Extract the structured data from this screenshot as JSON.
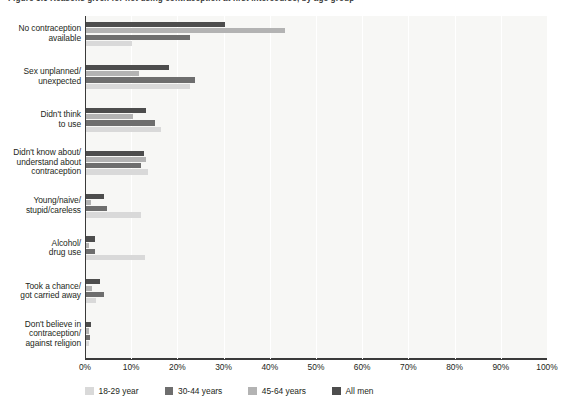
{
  "chart_data": {
    "type": "bar",
    "orientation": "horizontal",
    "title": "Figure 3.6  Reasons given for not using contraception at first intercourse, by age group",
    "xlabel": "",
    "ylabel": "",
    "xlim": [
      0,
      100
    ],
    "xtick_labels": [
      "0%",
      "10%",
      "20%",
      "30%",
      "40%",
      "50%",
      "60%",
      "70%",
      "80%",
      "90%",
      "100%"
    ],
    "xtick_values": [
      0,
      10,
      20,
      30,
      40,
      50,
      60,
      70,
      80,
      90,
      100
    ],
    "grid": true,
    "legend_position": "bottom",
    "categories": [
      "No contraception available",
      "Sex unplanned/ unexpected",
      "Didn't think to use",
      "Didn't know about/ understand about contraception",
      "Young/naive/ stupid/careless",
      "Alcohol/ drug use",
      "Took a chance/ got carried away",
      "Don't believe in contraception/ against religion"
    ],
    "category_lines": [
      [
        "No contraception",
        "available"
      ],
      [
        "Sex unplanned/",
        "unexpected"
      ],
      [
        "Didn't think",
        "to use"
      ],
      [
        "Didn't know about/",
        "understand about",
        "contraception"
      ],
      [
        "Young/naive/",
        "stupid/careless"
      ],
      [
        "Alcohol/",
        "drug use"
      ],
      [
        "Took a chance/",
        "got carried away"
      ],
      [
        "Don't believe in",
        "contraception/",
        "against religion"
      ]
    ],
    "series": [
      {
        "name": "All men",
        "color": "#4d4d4d",
        "values": [
          30.0,
          18.0,
          13.0,
          12.5,
          4.0,
          2.0,
          3.0,
          1.0
        ]
      },
      {
        "name": "45-64 years",
        "color": "#b3b3b3",
        "values": [
          43.0,
          11.5,
          10.2,
          13.0,
          1.0,
          0.7,
          1.2,
          0.7
        ]
      },
      {
        "name": "30-44 years",
        "color": "#6e6e6e",
        "values": [
          22.5,
          23.5,
          15.0,
          12.0,
          4.5,
          2.0,
          3.8,
          0.8
        ]
      },
      {
        "name": "18-29 year",
        "color": "#d9d9d9",
        "values": [
          10.0,
          22.5,
          16.2,
          13.5,
          12.0,
          12.8,
          2.2,
          0.6
        ]
      }
    ],
    "bar_order_top_to_bottom": [
      "All men",
      "45-64 years",
      "30-44 years",
      "18-29 year"
    ]
  },
  "legend": {
    "items": [
      {
        "label": "18-29 year",
        "color": "#d9d9d9"
      },
      {
        "label": "30-44 years",
        "color": "#6e6e6e"
      },
      {
        "label": "45-64 years",
        "color": "#b3b3b3"
      },
      {
        "label": "All men",
        "color": "#4d4d4d"
      }
    ]
  },
  "colors": {
    "plot_background": "#f7f7f5",
    "axis": "#3a3a3a",
    "gridline": "#ffffff",
    "text": "#231f20"
  }
}
